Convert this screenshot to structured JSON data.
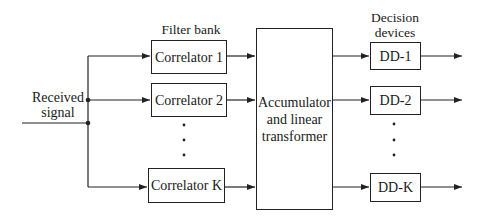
{
  "diagram": {
    "input_label": "Received signal",
    "input_label_lines": [
      "Received",
      "signal"
    ],
    "filter_bank_label": "Filter bank",
    "decision_devices_label_lines": [
      "Decision",
      "devices"
    ],
    "correlators": [
      {
        "label": "Correlator 1"
      },
      {
        "label": "Correlator 2"
      },
      {
        "label": "Correlator K"
      }
    ],
    "ellipsis": "⋮",
    "accumulator_lines": [
      "Accumulator",
      "and linear",
      "transformer"
    ],
    "decision_devices": [
      {
        "label": "DD-1"
      },
      {
        "label": "DD-2"
      },
      {
        "label": "DD-K"
      }
    ],
    "colors": {
      "line": "#222222",
      "background": "#ffffff"
    }
  }
}
